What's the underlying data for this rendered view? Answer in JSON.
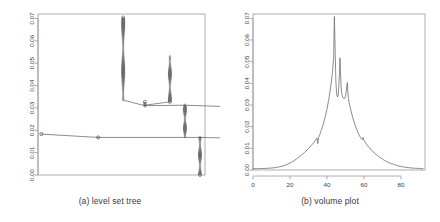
{
  "figure": {
    "background": "#ffffff",
    "line_color": "#6e6e6e",
    "axis_color": "#9a9a9a",
    "text_color": "#3a3a3a",
    "node_color": "#3c3c3c"
  },
  "panels": [
    {
      "id": "a",
      "caption": "(a) level set tree",
      "plot_area": {
        "left": 38,
        "top": 14,
        "right": 205,
        "bottom": 175
      }
    },
    {
      "id": "b",
      "caption": "(b) volume plot",
      "plot_area": {
        "left": 33,
        "top": 14,
        "right": 205,
        "bottom": 170
      }
    }
  ],
  "chart_data": [
    {
      "type": "tree",
      "title": "(a) level set tree",
      "xlabel": "",
      "ylabel": "",
      "ylim": [
        0.0,
        0.072
      ],
      "xlim": [
        0,
        100
      ],
      "yticks": [
        "0.00",
        "0.01",
        "0.02",
        "0.03",
        "0.04",
        "0.05",
        "0.06",
        "0.07"
      ],
      "ytick_values": [
        0.0,
        0.01,
        0.02,
        0.03,
        0.04,
        0.05,
        0.06,
        0.07
      ],
      "xticks": [],
      "grid": false,
      "legend": null,
      "note": "Level set tree: vertical branches drawn as dense stacks of small circles (level set nodes); horizontal segments join sibling branches at merge levels.",
      "branches": [
        {
          "name": "root-stub",
          "x": 2.0,
          "y_low": 0.0183,
          "y_high": 0.0183,
          "dense": false
        },
        {
          "name": "left-main",
          "x": 51.0,
          "y_low": 0.0335,
          "y_high": 0.0705,
          "dense": true
        },
        {
          "name": "left-merge",
          "x": 64.0,
          "y_low": 0.0307,
          "y_high": 0.0327,
          "dense": true
        },
        {
          "name": "middle-tall",
          "x": 79.0,
          "y_low": 0.0327,
          "y_high": 0.053,
          "dense": true
        },
        {
          "name": "center-trunk",
          "x": 88.0,
          "y_low": 0.0168,
          "y_high": 0.0312,
          "dense": true
        },
        {
          "name": "lower-trunk",
          "x": 97.0,
          "y_low": 0.0,
          "y_high": 0.0168,
          "dense": true
        },
        {
          "name": "right-branch",
          "x": 117.0,
          "y_low": 0.0305,
          "y_high": 0.04,
          "dense": true
        }
      ],
      "connectors": [
        {
          "from_x": 2.0,
          "from_y": 0.0183,
          "to_x": 36.0,
          "to_y": 0.0168
        },
        {
          "from_x": 36.0,
          "from_y": 0.0168,
          "to_x": 97.0,
          "to_y": 0.0168
        },
        {
          "from_x": 97.0,
          "from_y": 0.0168,
          "to_x": 136.0,
          "to_y": 0.0162
        },
        {
          "from_x": 51.0,
          "from_y": 0.0335,
          "to_x": 64.0,
          "to_y": 0.031
        },
        {
          "from_x": 64.0,
          "from_y": 0.031,
          "to_x": 88.0,
          "to_y": 0.0312
        },
        {
          "from_x": 79.0,
          "from_y": 0.0327,
          "to_x": 64.0,
          "to_y": 0.0312
        },
        {
          "from_x": 88.0,
          "from_y": 0.0312,
          "to_x": 117.0,
          "to_y": 0.0305
        }
      ],
      "leaf_nodes": [
        {
          "x": 2.0,
          "y": 0.0183
        },
        {
          "x": 36.0,
          "y": 0.0168
        },
        {
          "x": 136.0,
          "y": 0.0162
        }
      ]
    },
    {
      "type": "line",
      "title": "(b) volume plot",
      "xlabel": "",
      "ylabel": "",
      "xlim": [
        0,
        93
      ],
      "ylim": [
        0.0,
        0.072
      ],
      "xticks": [
        "0",
        "20",
        "40",
        "60",
        "80"
      ],
      "xtick_values": [
        0,
        20,
        40,
        60,
        80
      ],
      "yticks": [
        "0.00",
        "0.01",
        "0.02",
        "0.03",
        "0.04",
        "0.05",
        "0.06",
        "0.07"
      ],
      "ytick_values": [
        0.0,
        0.01,
        0.02,
        0.03,
        0.04,
        0.05,
        0.06,
        0.07
      ],
      "grid": false,
      "legend": null,
      "series": [
        {
          "name": "volume",
          "x": [
            0,
            2,
            4,
            6,
            8,
            10,
            12,
            14,
            16,
            18,
            20,
            22,
            24,
            26,
            28,
            30,
            32,
            33,
            34,
            34.6,
            35,
            35.2,
            35.4,
            36,
            37,
            38,
            39,
            40,
            41,
            42,
            43,
            43.6,
            44,
            44.4,
            44.8,
            45.2,
            45.6,
            46,
            46.4,
            46.8,
            47,
            47.3,
            47.6,
            48,
            48.5,
            49,
            49.6,
            50,
            50.4,
            50.8,
            51,
            51.3,
            51.6,
            52,
            53,
            54,
            55,
            56,
            57,
            58,
            59,
            59.5,
            60,
            61,
            62,
            64,
            66,
            68,
            70,
            72,
            74,
            76,
            78,
            80,
            82,
            84,
            86,
            88,
            90,
            92
          ],
          "y": [
            0.0006,
            0.0006,
            0.0007,
            0.0007,
            0.0008,
            0.0009,
            0.0011,
            0.0014,
            0.0018,
            0.0024,
            0.0032,
            0.0042,
            0.0054,
            0.0067,
            0.0082,
            0.0099,
            0.0118,
            0.0128,
            0.0139,
            0.0148,
            0.0122,
            0.013,
            0.0148,
            0.0161,
            0.0184,
            0.0211,
            0.0243,
            0.0281,
            0.0327,
            0.0382,
            0.0452,
            0.052,
            0.0708,
            0.056,
            0.041,
            0.0352,
            0.0338,
            0.034,
            0.0385,
            0.046,
            0.0518,
            0.0455,
            0.039,
            0.0352,
            0.0336,
            0.033,
            0.0331,
            0.034,
            0.0362,
            0.0392,
            0.0404,
            0.036,
            0.033,
            0.031,
            0.0272,
            0.024,
            0.0212,
            0.0188,
            0.0168,
            0.0152,
            0.014,
            0.015,
            0.0136,
            0.0124,
            0.0112,
            0.0092,
            0.0076,
            0.0062,
            0.005,
            0.004,
            0.0032,
            0.0026,
            0.002,
            0.0016,
            0.0013,
            0.0011,
            0.0009,
            0.0008,
            0.0007,
            0.0006
          ]
        }
      ]
    }
  ]
}
